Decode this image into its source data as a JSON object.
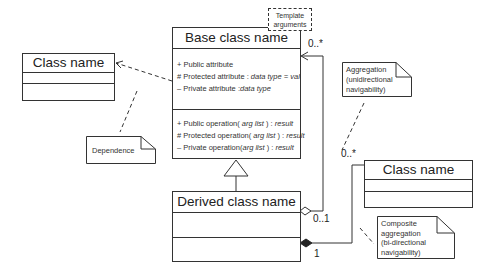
{
  "diagram": {
    "type": "UML class diagram",
    "base_class": {
      "name": "Base class name",
      "template_note": "Template arguments",
      "attributes": [
        {
          "vis": "+",
          "text": "Public attribute",
          "italic": ""
        },
        {
          "vis": "#",
          "text": "Protected attribute : ",
          "italic": "data type = val"
        },
        {
          "vis": "–",
          "text": "Private attribute :",
          "italic": "data type"
        }
      ],
      "operations": [
        {
          "vis": "+",
          "text": "Public operation( ",
          "italic": "arg list",
          "tail": " ) : ",
          "ret": "result"
        },
        {
          "vis": "#",
          "text": "Protected operation( ",
          "italic": "arg list",
          "tail": " ) : ",
          "ret": "result"
        },
        {
          "vis": "–",
          "text": "Private operation(",
          "italic": "arg list",
          "tail": " ) : ",
          "ret": "result"
        }
      ]
    },
    "derived_class": {
      "name": "Derived class name"
    },
    "left_class": {
      "name": "Class name"
    },
    "right_class": {
      "name": "Class name"
    },
    "notes": {
      "dependence": "Dependence",
      "aggregation": [
        "Aggregation",
        "(unidirectional",
        "navigability)"
      ],
      "composite": [
        "Composite",
        "aggregation",
        "(bi-directional",
        "navigability)"
      ]
    },
    "multiplicities": {
      "aggregation_target": "0..*",
      "aggregation_source": "0..1",
      "composite_target": "0..*",
      "composite_source": "1"
    },
    "colors": {
      "line": "#333333",
      "background": "#ffffff"
    }
  }
}
